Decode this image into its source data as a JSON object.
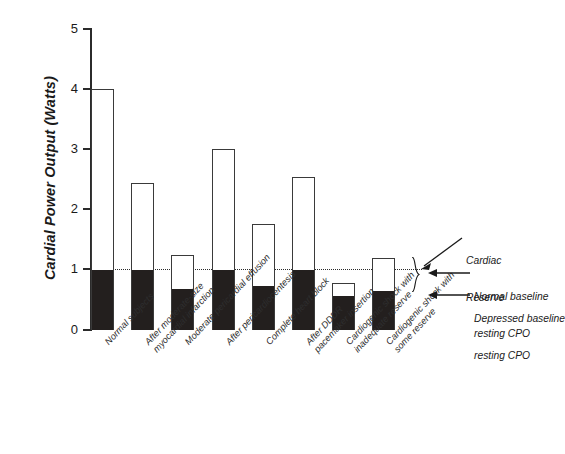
{
  "chart_data": {
    "type": "bar",
    "title": "",
    "xlabel": "",
    "ylabel": "Cardial Power Output (Watts)",
    "ylim": [
      0,
      5
    ],
    "yticks": [
      0,
      1,
      2,
      3,
      4,
      5
    ],
    "ytick_labels": [
      "0",
      "1",
      "2",
      "3",
      "4",
      "5"
    ],
    "grid": false,
    "legend": "none",
    "reference_line": {
      "value": 1.0,
      "style": "dotted",
      "label": "Normal baseline resting CPO"
    },
    "categories": [
      "Normal subjects",
      "After moderate-size myocardial infarction",
      "Moderate pericardial effusion",
      "After pericardiocentesis",
      "Complete heart block",
      "After DDDR pacemaker insertion",
      "Cardiogenic shock with inadequate reserve",
      "Cardiogenic shock with some reserve"
    ],
    "series": [
      {
        "name": "Baseline resting CPO",
        "fill": "black",
        "values": [
          1.0,
          1.0,
          0.68,
          1.0,
          0.73,
          1.0,
          0.57,
          0.65
        ]
      },
      {
        "name": "Peak CPO (total bar height)",
        "fill": "white",
        "values": [
          4.0,
          2.43,
          1.25,
          3.0,
          1.75,
          2.53,
          0.78,
          1.2
        ]
      }
    ],
    "annotations": [
      "Cardiac\nReserve",
      "Normal baseline\nresting CPO",
      "Depressed baseline\nresting CPO"
    ]
  },
  "axis": {
    "y_title": "Cardial Power Output (Watts)",
    "ticks": [
      {
        "label": "5",
        "value": 5
      },
      {
        "label": "4",
        "value": 4
      },
      {
        "label": "3",
        "value": 3
      },
      {
        "label": "2",
        "value": 2
      },
      {
        "label": "1",
        "value": 1
      },
      {
        "label": "0",
        "value": 0
      }
    ]
  },
  "x_labels": [
    {
      "line1": "Normal subjects",
      "line2": ""
    },
    {
      "line1": "After moderate-size",
      "line2": "myocardial infarction"
    },
    {
      "line1": "Moderate pericardial effusion",
      "line2": ""
    },
    {
      "line1": "After pericardiocentesis",
      "line2": ""
    },
    {
      "line1": "Complete heart block",
      "line2": ""
    },
    {
      "line1": "After DDDR",
      "line2": "pacemaker insertion"
    },
    {
      "line1": "Cardiogenic shock with",
      "line2": "inadequate reserve"
    },
    {
      "line1": "Cardiogenic shock with",
      "line2": "some reserve"
    }
  ],
  "callouts": {
    "cardiac_reserve_line1": "Cardiac",
    "cardiac_reserve_line2": "Reserve",
    "normal_baseline_line1": "Normal baseline",
    "normal_baseline_line2": "resting CPO",
    "depressed_baseline_line1": "Depressed baseline",
    "depressed_baseline_line2": "resting CPO"
  },
  "colors": {
    "bar_fill_black": "#231f1e",
    "bar_fill_white": "#ffffff",
    "bar_stroke": "#3a3a3a",
    "axis": "#2b2b2b",
    "text": "#1a1a1a"
  }
}
